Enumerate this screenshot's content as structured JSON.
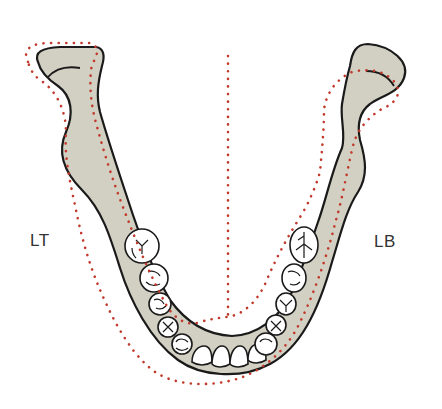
{
  "diagram": {
    "labels": {
      "left": "LT",
      "right": "LB"
    },
    "colors": {
      "bone_fill": "#d2cfc3",
      "outline": "#1a1a1a",
      "dotted_outline": "#c0392b",
      "tooth_fill": "#ffffff"
    },
    "elements": [
      {
        "id": "mandible",
        "description": "U-shaped jaw bone with two rami"
      },
      {
        "id": "teeth",
        "description": "lower dental arch: molars, premolars, canines, incisors"
      },
      {
        "id": "midline",
        "description": "vertical dotted midline"
      },
      {
        "id": "dotted-outline",
        "description": "red dotted outline showing shifted/alternate jaw position"
      }
    ]
  }
}
